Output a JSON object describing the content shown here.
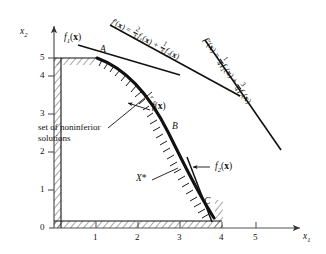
{
  "figure": {
    "type": "xy-plot",
    "axes": {
      "x_label": "x1",
      "y_label": "x2",
      "x_ticks": [
        "1",
        "2",
        "3",
        "4",
        "5"
      ],
      "y_ticks": [
        "0",
        "1",
        "2",
        "3",
        "4",
        "5"
      ],
      "x_range": [
        0,
        5.8
      ],
      "y_range": [
        0,
        5.8
      ],
      "origin_label": "0"
    },
    "curve_labels": {
      "f1": "f1(x)",
      "f2": "f2(x)",
      "fhat": "f̂(x)"
    },
    "points": [
      {
        "name": "A",
        "label": "A",
        "x": 1.0,
        "y": 5.0
      },
      {
        "name": "B",
        "label": "B",
        "x": 3.0,
        "y": 3.0
      },
      {
        "name": "C",
        "label": "C",
        "x": 4.0,
        "y": 0.85
      }
    ],
    "region_label": "X*",
    "annotation": {
      "line1": "set of noninferior",
      "line2": "solutions"
    },
    "equations": [
      {
        "id": "f-prime",
        "lhs": "f'(x)",
        "eq": "=",
        "term1_num": "2",
        "term1_den": "3",
        "term1_fn": "f1(x)",
        "plus": "+",
        "term2_num": "1",
        "term2_den": "3",
        "term2_fn": "f2(x)"
      },
      {
        "id": "f-double-prime",
        "lhs": "f''(x)",
        "eq": "=",
        "term1_num": "1",
        "term1_den": "4",
        "term1_fn": "f1(x)",
        "plus": "+",
        "term2_num": "3",
        "term2_den": "4",
        "term2_fn": "f2(x)"
      }
    ],
    "colors": {
      "ink": "#111111",
      "axis": "#555555",
      "background": "#ffffff"
    }
  }
}
